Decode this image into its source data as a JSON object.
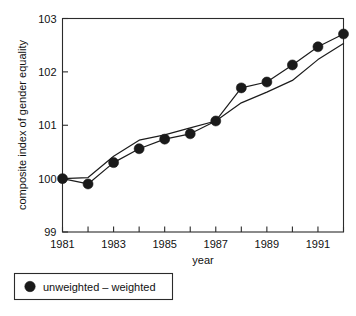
{
  "chart_data": {
    "type": "line",
    "title": "",
    "xlabel": "year",
    "ylabel": "composite index of gender equality",
    "xlim": [
      1981,
      1992
    ],
    "ylim": [
      99,
      103
    ],
    "grid": false,
    "legend_position": "below-left",
    "x": [
      1981,
      1982,
      1983,
      1984,
      1985,
      1986,
      1987,
      1988,
      1989,
      1990,
      1991,
      1992
    ],
    "xticks": [
      1981,
      1982,
      1983,
      1984,
      1985,
      1986,
      1987,
      1988,
      1989,
      1990,
      1991,
      1992
    ],
    "xtick_labels": [
      "1981",
      "",
      "1983",
      "",
      "1985",
      "",
      "1987",
      "",
      "1989",
      "",
      "1991",
      ""
    ],
    "yticks": [
      99,
      100,
      101,
      102,
      103
    ],
    "ytick_labels": [
      "99",
      "100",
      "101",
      "102",
      "103"
    ],
    "series": [
      {
        "name": "unweighted",
        "marker": "filled-circle",
        "has_markers": true,
        "values": [
          100.0,
          99.9,
          100.3,
          100.56,
          100.74,
          100.84,
          101.08,
          101.7,
          101.81,
          102.13,
          102.47,
          102.71
        ]
      },
      {
        "name": "weighted",
        "marker": "none",
        "has_markers": false,
        "values": [
          100.0,
          100.02,
          100.42,
          100.72,
          100.82,
          100.95,
          101.08,
          101.42,
          101.62,
          101.84,
          102.23,
          102.53
        ]
      }
    ]
  },
  "legend": {
    "label": "unweighted – weighted",
    "marker_name": "filled-circle-marker"
  },
  "axes": {
    "x_title": "year",
    "y_title": "composite index of gender equality"
  }
}
